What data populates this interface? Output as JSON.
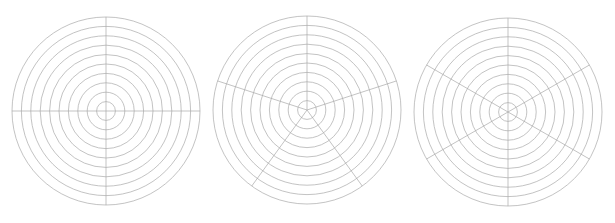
{
  "figure": {
    "title": "",
    "background_color": "#ffffff",
    "width": 615,
    "height": 223,
    "panel_count": 3
  },
  "style": {
    "line_color": "#a9a9a9",
    "line_width": 0.7,
    "fill": "none"
  },
  "chart_data": [
    {
      "type": "polar-grid",
      "name": "polar-grid-4-spokes",
      "title": "",
      "subtitle": "",
      "xlabel": "",
      "ylabel": "",
      "center": [
        106,
        111
      ],
      "outer_radius": 94,
      "ring_count": 10,
      "ring_radii": [
        9.4,
        18.8,
        28.2,
        37.6,
        47,
        56.4,
        65.8,
        75.2,
        84.6,
        94
      ],
      "spoke_count": 4,
      "spoke_angles_deg": [
        0,
        90,
        180,
        270
      ],
      "tick_labels": [],
      "legend": [],
      "grid": true,
      "legend_position": "none",
      "annotations": []
    },
    {
      "type": "polar-grid",
      "name": "polar-grid-5-spokes",
      "title": "",
      "subtitle": "",
      "xlabel": "",
      "ylabel": "",
      "center": [
        307,
        110
      ],
      "outer_radius": 94,
      "ring_count": 10,
      "ring_radii": [
        9.4,
        18.8,
        28.2,
        37.6,
        47,
        56.4,
        65.8,
        75.2,
        84.6,
        94
      ],
      "spoke_count": 5,
      "spoke_angles_deg": [
        90,
        162,
        234,
        306,
        18
      ],
      "tick_labels": [],
      "legend": [],
      "grid": true,
      "legend_position": "none",
      "annotations": []
    },
    {
      "type": "polar-grid",
      "name": "polar-grid-6-spokes",
      "title": "",
      "subtitle": "",
      "xlabel": "",
      "ylabel": "",
      "center": [
        508,
        112
      ],
      "outer_radius": 94,
      "ring_count": 10,
      "ring_radii": [
        9.4,
        18.8,
        28.2,
        37.6,
        47,
        56.4,
        65.8,
        75.2,
        84.6,
        94
      ],
      "spoke_count": 6,
      "spoke_angles_deg": [
        30,
        90,
        150,
        210,
        270,
        330
      ],
      "tick_labels": [],
      "legend": [],
      "grid": true,
      "legend_position": "none",
      "annotations": []
    }
  ]
}
